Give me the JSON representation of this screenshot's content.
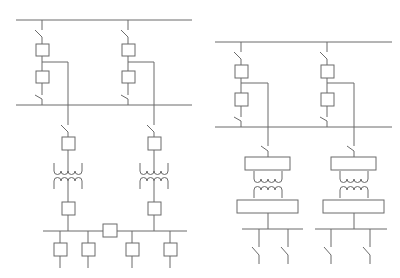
{
  "diagram": {
    "type": "electrical single-line diagram",
    "stroke_color": "#6b6b6b",
    "background_color": "#ffffff",
    "schemes": [
      {
        "id": "left-scheme",
        "description": "Double busbar with two incoming bays, two-winding transformers, sectionalized LV bus with bus-tie breaker and four feeders",
        "incoming_bays": 2,
        "transformers": 2,
        "bus_tie_breaker": true,
        "feeders": 4
      },
      {
        "id": "right-scheme",
        "description": "Double busbar with two incoming bays, transformers with switchgear blocks, two separate LV buses each with two switched feeders",
        "incoming_bays": 2,
        "transformers": 2,
        "bus_tie_breaker": false,
        "feeders": 4
      }
    ]
  }
}
